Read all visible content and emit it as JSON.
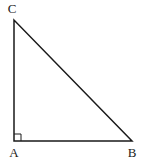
{
  "diagram": {
    "type": "right-triangle",
    "colors": {
      "stroke": "#1a1a1a",
      "label": "#222222",
      "background": "#ffffff"
    },
    "vertices": [
      {
        "id": "A",
        "label": "A",
        "x": 14,
        "y": 141,
        "label_x": 14,
        "label_y": 157,
        "anchor": "middle"
      },
      {
        "id": "B",
        "label": "B",
        "x": 132,
        "y": 141,
        "label_x": 132,
        "label_y": 157,
        "anchor": "middle"
      },
      {
        "id": "C",
        "label": "C",
        "x": 14,
        "y": 20,
        "label_x": 12,
        "label_y": 13,
        "anchor": "middle"
      }
    ],
    "right_angle_at": "A",
    "right_angle_marker_size": 7
  }
}
